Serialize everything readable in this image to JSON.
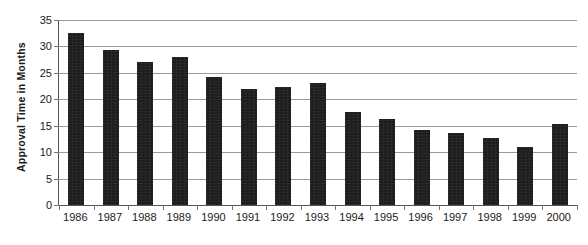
{
  "chart_data": {
    "type": "bar",
    "title": "",
    "xlabel": "",
    "ylabel": "Approval Time in Months",
    "categories": [
      "1986",
      "1987",
      "1988",
      "1989",
      "1990",
      "1991",
      "1992",
      "1993",
      "1994",
      "1995",
      "1996",
      "1997",
      "1998",
      "1999",
      "2000"
    ],
    "values": [
      32.5,
      29.3,
      27.1,
      28.0,
      24.2,
      22.0,
      22.4,
      23.0,
      17.6,
      16.3,
      14.2,
      13.6,
      12.7,
      11.0,
      15.4
    ],
    "series": [
      {
        "name": "Approval Time",
        "values": [
          32.5,
          29.3,
          27.1,
          28.0,
          24.2,
          22.0,
          22.4,
          23.0,
          17.6,
          16.3,
          14.2,
          13.6,
          12.7,
          11.0,
          15.4
        ]
      }
    ],
    "ylim": [
      0,
      35
    ],
    "yticks": [
      0,
      5,
      10,
      15,
      20,
      25,
      30,
      35
    ],
    "ytick_labels": [
      "0",
      "5",
      "10",
      "15",
      "20",
      "25",
      "30",
      "35"
    ],
    "grid": true,
    "legend": false,
    "legend_position": "none",
    "bar_color": "#1d1d1d",
    "gridline_color": "#9a9a9a",
    "axis_color": "#555555",
    "background_color": "#ffffff"
  }
}
